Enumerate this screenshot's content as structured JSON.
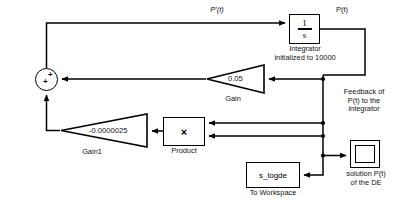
{
  "diagram": {
    "background": "#ffffff",
    "line_color": "#000000",
    "text_color": "#111111"
  },
  "blocks": {
    "integrator": {
      "numerator": "1",
      "denominator": "s",
      "caption": "Integrator\ninitialized to 10000",
      "initial_condition": "10000"
    },
    "gain": {
      "value": "0.05",
      "caption": "Gain"
    },
    "gain1": {
      "value": "-0.0000025",
      "caption": "Gain1"
    },
    "product": {
      "symbol": "×",
      "caption": "Product"
    },
    "toworkspace": {
      "variable": "s_logde",
      "caption": "To Workspace"
    },
    "scope": {
      "caption": "solution P(t)\nof the DE"
    },
    "sum": {
      "sign_1": "+",
      "sign_2": "+"
    }
  },
  "signal_labels": {
    "derivative": "P'(t)",
    "output": "P(t)",
    "feedback_note": "Feedback of\nP(t) to the\nintegrator"
  }
}
